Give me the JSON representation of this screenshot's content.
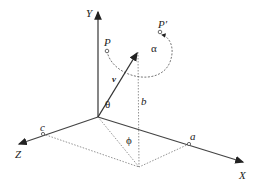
{
  "diagram": {
    "axes": {
      "y": "Y",
      "x": "X",
      "z": "Z"
    },
    "points": {
      "p": "P",
      "p_prime": "P′",
      "a": "a",
      "b": "b",
      "c": "c"
    },
    "vector": "v",
    "angles": {
      "alpha": "α",
      "theta": "θ",
      "phi": "ϕ"
    },
    "colors": {
      "line": "#333333",
      "dotted": "#777777"
    }
  }
}
